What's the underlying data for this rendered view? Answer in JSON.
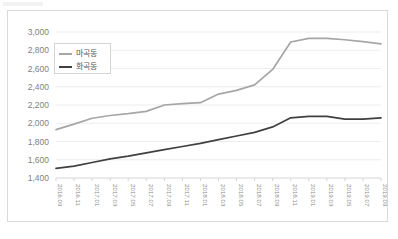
{
  "chart_data": {
    "type": "line",
    "title": "",
    "subtitle": "",
    "xlabel": "",
    "ylabel": "",
    "ylim": [
      1400,
      3000
    ],
    "ytick_step": 200,
    "grid": true,
    "legend_position": "inside-top-left",
    "yticks": [
      "3,000",
      "2,800",
      "2,600",
      "2,400",
      "2,200",
      "2,000",
      "1,800",
      "1,600",
      "1,400"
    ],
    "ytick_values": [
      3000,
      2800,
      2600,
      2400,
      2200,
      2000,
      1800,
      1600,
      1400
    ],
    "categories": [
      "2016.09",
      "2016.11",
      "2017.01",
      "2017.03",
      "2017.05",
      "2017.07",
      "2017.09",
      "2017.11",
      "2018.01",
      "2018.03",
      "2018.05",
      "2018.07",
      "2018.09",
      "2018.11",
      "2019.01",
      "2019.03",
      "2019.05",
      "2019.07",
      "2019.09"
    ],
    "series": [
      {
        "name": "마곡동",
        "color": "#a6a6a6",
        "values": [
          1930,
          1990,
          2055,
          2085,
          2105,
          2130,
          2200,
          2215,
          2225,
          2320,
          2360,
          2420,
          2590,
          2890,
          2930,
          2930,
          2915,
          2895,
          2870
        ]
      },
      {
        "name": "화곡동",
        "color": "#404040",
        "values": [
          1505,
          1530,
          1570,
          1610,
          1640,
          1675,
          1710,
          1745,
          1780,
          1820,
          1860,
          1900,
          1960,
          2060,
          2075,
          2075,
          2045,
          2045,
          2060
        ]
      }
    ]
  },
  "legend": {
    "items": [
      {
        "label": "마곡동",
        "color": "#a6a6a6"
      },
      {
        "label": "화곡동",
        "color": "#404040"
      }
    ]
  },
  "colors": {
    "series_light": "#a6a6a6",
    "series_dark": "#404040",
    "grid": "#e8e8e8",
    "frame_border": "#d9d9d9",
    "tick_text": "#7f7f7f"
  }
}
